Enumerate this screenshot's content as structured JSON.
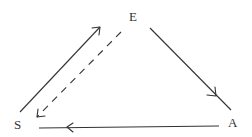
{
  "diagram": {
    "nodes": [
      {
        "id": "E",
        "label": "E",
        "x": 133,
        "y": 21
      },
      {
        "id": "S",
        "label": "S",
        "x": 18,
        "y": 128
      },
      {
        "id": "A",
        "label": "A",
        "x": 232,
        "y": 127
      }
    ],
    "edges": [
      {
        "from": "S",
        "to": "E",
        "style": "solid"
      },
      {
        "from": "E",
        "to": "S",
        "style": "dashed"
      },
      {
        "from": "E",
        "to": "A",
        "style": "solid"
      },
      {
        "from": "A",
        "to": "S",
        "style": "solid"
      }
    ],
    "colors": {
      "stroke": "#333333",
      "background": "#ffffff"
    }
  }
}
